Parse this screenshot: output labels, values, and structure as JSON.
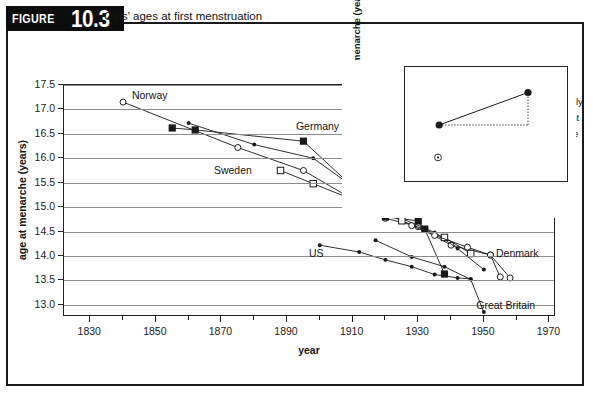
{
  "figure": {
    "label_word": "FIGURE",
    "number": "10.3",
    "caption": "Girls' ages at first menstruation"
  },
  "chart_data": {
    "type": "line",
    "title": "Girls' ages at first menstruation",
    "xlabel": "year",
    "ylabel": "age at menarche (years)",
    "xlim": [
      1822,
      1972
    ],
    "ylim": [
      12.75,
      17.5
    ],
    "grid": true,
    "legend_position": "inline-labels",
    "x_ticks_major": [
      1830,
      1850,
      1870,
      1890,
      1910,
      1930,
      1950,
      1970
    ],
    "x_ticks_minor": [
      1840,
      1860,
      1880,
      1900,
      1920,
      1940,
      1960
    ],
    "y_ticks": [
      13.0,
      13.5,
      14.0,
      14.5,
      15.0,
      15.5,
      16.0,
      16.5,
      17.0,
      17.5
    ],
    "series": [
      {
        "name": "Norway",
        "marker": "open-circle",
        "label_x": 1843,
        "label_y": 17.26,
        "points": [
          {
            "x": 1840,
            "y": 17.15
          },
          {
            "x": 1875,
            "y": 16.22
          },
          {
            "x": 1895,
            "y": 15.75
          },
          {
            "x": 1920,
            "y": 14.77
          },
          {
            "x": 1930,
            "y": 14.6
          },
          {
            "x": 1940,
            "y": 14.22
          },
          {
            "x": 1952,
            "y": 14.02
          },
          {
            "x": 1958,
            "y": 13.55
          }
        ]
      },
      {
        "name": "Germany",
        "marker": "filled-square",
        "label_x": 1893,
        "label_y": 16.62,
        "points": [
          {
            "x": 1855,
            "y": 16.62
          },
          {
            "x": 1862,
            "y": 16.58
          },
          {
            "x": 1895,
            "y": 16.35
          },
          {
            "x": 1920,
            "y": 14.8
          },
          {
            "x": 1930,
            "y": 14.72
          },
          {
            "x": 1932,
            "y": 14.55
          },
          {
            "x": 1938,
            "y": 13.63
          }
        ]
      },
      {
        "name": "Finland",
        "marker": "small-dot",
        "label_x": 1908,
        "label_y": 16.18,
        "points": [
          {
            "x": 1860,
            "y": 16.72
          },
          {
            "x": 1880,
            "y": 16.28
          },
          {
            "x": 1898,
            "y": 16.0
          },
          {
            "x": 1922,
            "y": 14.85
          },
          {
            "x": 1935,
            "y": 14.48
          },
          {
            "x": 1942,
            "y": 14.15
          },
          {
            "x": 1950,
            "y": 13.72
          }
        ]
      },
      {
        "name": "Sweden",
        "marker": "open-square",
        "label_x": 1868,
        "label_y": 15.72,
        "points": [
          {
            "x": 1888,
            "y": 15.75
          },
          {
            "x": 1898,
            "y": 15.48
          },
          {
            "x": 1915,
            "y": 15.02
          },
          {
            "x": 1925,
            "y": 14.72
          },
          {
            "x": 1938,
            "y": 14.38
          },
          {
            "x": 1946,
            "y": 14.05
          }
        ]
      },
      {
        "name": "Denmark",
        "marker": "open-circle-square",
        "label_x": 1954,
        "label_y": 14.02,
        "points": [
          {
            "x": 1928,
            "y": 14.62
          },
          {
            "x": 1935,
            "y": 14.42
          },
          {
            "x": 1945,
            "y": 14.18
          },
          {
            "x": 1952,
            "y": 14.02
          },
          {
            "x": 1955,
            "y": 13.57
          }
        ]
      },
      {
        "name": "US",
        "marker": "small-dot",
        "label_x": 1897,
        "label_y": 14.02,
        "points": [
          {
            "x": 1900,
            "y": 14.22
          },
          {
            "x": 1912,
            "y": 14.08
          },
          {
            "x": 1920,
            "y": 13.92
          },
          {
            "x": 1928,
            "y": 13.78
          },
          {
            "x": 1935,
            "y": 13.62
          },
          {
            "x": 1942,
            "y": 13.55
          },
          {
            "x": 1946,
            "y": 13.53
          }
        ]
      },
      {
        "name": "Great Britain",
        "marker": "small-dot",
        "label_x": 1948,
        "label_y": 12.95,
        "points": [
          {
            "x": 1917,
            "y": 14.32
          },
          {
            "x": 1928,
            "y": 13.98
          },
          {
            "x": 1938,
            "y": 13.78
          },
          {
            "x": 1946,
            "y": 13.52
          },
          {
            "x": 1950,
            "y": 12.85
          }
        ]
      }
    ]
  },
  "inset_chart": {
    "type": "line",
    "title": "New Zealand: Age at menarche",
    "xlabel": "year",
    "ylabel": "median age at menarche (years)",
    "xlim": [
      1964,
      1988
    ],
    "ylim": [
      12.5,
      13.5
    ],
    "y_ticks_labeled": [
      12.5,
      13.0,
      13.5
    ],
    "y_ticks_minor": [
      12.75,
      13.25
    ],
    "x_ticks": [
      1969,
      1982
    ],
    "annotation": "statistically significant difference",
    "annotation_line1": "statistically",
    "annotation_line2": "significant",
    "annotation_line3": "difference",
    "series": [
      {
        "name": "Pakeha girls",
        "marker": "filled-circle",
        "label_x": 1970.5,
        "label_y": 13.33,
        "points": [
          {
            "x": 1969,
            "y": 13.0
          },
          {
            "x": 1982,
            "y": 13.28
          }
        ]
      },
      {
        "name": "Maori girls",
        "marker": "dotted-circle",
        "label_x": 1970.0,
        "label_y": 12.72,
        "points": []
      }
    ]
  },
  "colors": {
    "ink": "#1a1a1a",
    "grid": "#8c8c8c",
    "banner_bg": "#0d0d0d",
    "banner_fg": "#ffffff",
    "plot_bg": "#ffffff"
  }
}
